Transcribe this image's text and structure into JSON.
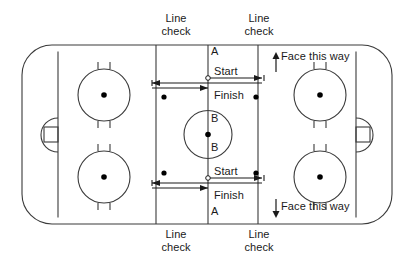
{
  "diagram": {
    "colors": {
      "line": "#3a3a3a",
      "text": "#1a1a1a",
      "background": "#ffffff",
      "dot": "#000000"
    },
    "labels": {
      "line_check_top_left": {
        "line1": "Line",
        "line2": "check"
      },
      "line_check_top_right": {
        "line1": "Line",
        "line2": "check"
      },
      "line_check_bottom_left": {
        "line1": "Line",
        "line2": "check"
      },
      "line_check_bottom_right": {
        "line1": "Line",
        "line2": "check"
      },
      "point_a_top": "A",
      "point_a_bottom": "A",
      "point_b_top": "B",
      "point_b_bottom": "B",
      "start_top": "Start",
      "finish_top": "Finish",
      "start_bottom": "Start",
      "finish_bottom": "Finish",
      "face_this_way_top": "Face this way",
      "face_this_way_bottom": "Face this way"
    },
    "icons": {
      "arrow_up": "arrow-up-icon",
      "arrow_down": "arrow-down-icon",
      "arrow_right": "arrow-right-icon",
      "arrow_left": "arrow-left-icon"
    },
    "geometry": {
      "rink_left": 22,
      "rink_top": 45,
      "rink_right": 392,
      "rink_bottom": 224,
      "corner_radius": 30,
      "goal_line_left": 58,
      "goal_line_right": 356,
      "blue_line_left": 156,
      "blue_line_right": 258,
      "center_line": 208,
      "center_circle_r": 24,
      "faceoff_circle_r": 26,
      "faceoff_circles": [
        {
          "cx": 104,
          "cy": 95
        },
        {
          "cx": 104,
          "cy": 177
        },
        {
          "cx": 320,
          "cy": 95
        },
        {
          "cx": 320,
          "cy": 177
        }
      ],
      "neutral_dots": [
        {
          "cx": 164,
          "cy": 97
        },
        {
          "cx": 256,
          "cy": 97
        },
        {
          "cx": 164,
          "cy": 173
        },
        {
          "cx": 256,
          "cy": 173
        }
      ]
    }
  }
}
